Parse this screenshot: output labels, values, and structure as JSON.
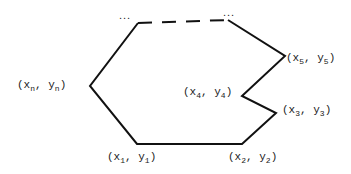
{
  "diagram": {
    "type": "polygon",
    "stroke_color": "#111111",
    "vertices": [
      {
        "id": "v1",
        "label_x": "x",
        "sub_x": "1",
        "label_y": "y",
        "sub_y": "1"
      },
      {
        "id": "v2",
        "label_x": "x",
        "sub_x": "2",
        "label_y": "y",
        "sub_y": "2"
      },
      {
        "id": "v3",
        "label_x": "x",
        "sub_x": "3",
        "label_y": "y",
        "sub_y": "3"
      },
      {
        "id": "v4",
        "label_x": "x",
        "sub_x": "4",
        "label_y": "y",
        "sub_y": "4"
      },
      {
        "id": "v5",
        "label_x": "x",
        "sub_x": "5",
        "label_y": "y",
        "sub_y": "5"
      },
      {
        "id": "vn",
        "label_x": "x",
        "sub_x": "n",
        "label_y": "y",
        "sub_y": "n"
      }
    ],
    "ellipsis": "...",
    "punct": {
      "open": "(",
      "sep": ", ",
      "close": ")"
    }
  }
}
